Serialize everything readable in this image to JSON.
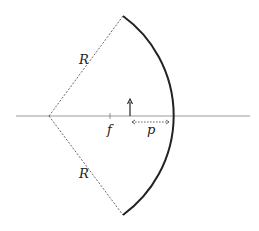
{
  "diagram": {
    "labels": {
      "radius_upper": "R",
      "radius_lower": "R",
      "focal_point": "f",
      "object_distance": "p"
    },
    "colors": {
      "axis": "#9a9a9a",
      "mirror": "#222222",
      "dashed": "#555555",
      "object_arrow": "#222222"
    }
  }
}
